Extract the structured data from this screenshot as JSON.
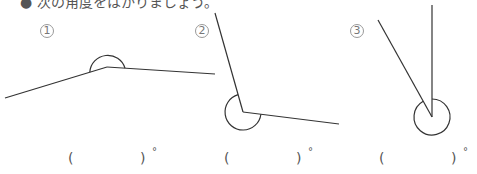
{
  "instruction": "● 次の角度をはかりましょう。",
  "problems": [
    {
      "number": "1",
      "answer_open": "(",
      "answer_value": "",
      "answer_close": ")",
      "unit": "°"
    },
    {
      "number": "2",
      "answer_open": "(",
      "answer_value": "",
      "answer_close": ")",
      "unit": "°"
    },
    {
      "number": "3",
      "answer_open": "(",
      "answer_value": "",
      "answer_close": ")",
      "unit": "°"
    }
  ],
  "colors": {
    "line": "#333333",
    "text": "#555555"
  }
}
